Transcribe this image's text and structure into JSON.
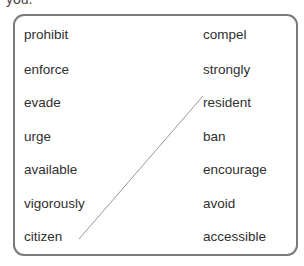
{
  "header_fragment": "you.",
  "matching": {
    "left_column": [
      "prohibit",
      "enforce",
      "evade",
      "urge",
      "available",
      "vigorously",
      "citizen"
    ],
    "right_column": [
      "compel",
      "strongly",
      "resident",
      "ban",
      "encourage",
      "avoid",
      "accessible"
    ],
    "connections": [
      {
        "from": "citizen",
        "to": "resident"
      }
    ]
  },
  "colors": {
    "border": "#7a7a7a",
    "text": "#2f2f2f",
    "line": "#8a8a8a"
  }
}
